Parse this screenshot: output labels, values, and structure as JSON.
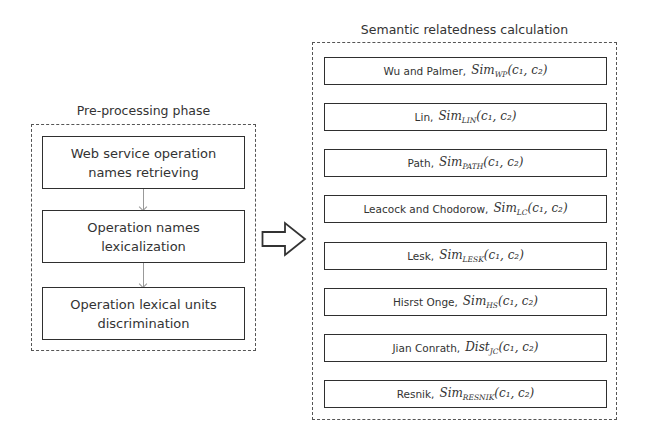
{
  "left_panel": {
    "title": "Pre-processing phase",
    "steps": [
      {
        "line1": "Web service operation",
        "line2": "names retrieving"
      },
      {
        "line1": "Operation names",
        "line2": "lexicalization"
      },
      {
        "line1": "Operation lexical units",
        "line2": "discrimination"
      }
    ]
  },
  "connector": {
    "icon": "block-arrow-right-icon"
  },
  "right_panel": {
    "title": "Semantic relatedness calculation",
    "measures": [
      {
        "name": "Wu and Palmer,",
        "fn": "Sim",
        "sub": "WP",
        "args": "(c₁, c₂)"
      },
      {
        "name": "Lin,",
        "fn": "Sim",
        "sub": "LIN",
        "args": "(c₁, c₂)"
      },
      {
        "name": "Path,",
        "fn": "Sim",
        "sub": "PATH",
        "args": "(c₁, c₂)"
      },
      {
        "name": "Leacock and Chodorow,",
        "fn": "Sim",
        "sub": "LC",
        "args": "(c₁, c₂)"
      },
      {
        "name": "Lesk,",
        "fn": "Sim",
        "sub": "LESK",
        "args": "(c₁, c₂)"
      },
      {
        "name": "Hisrst Onge,",
        "fn": "Sim",
        "sub": "HS",
        "args": "(c₁, c₂)"
      },
      {
        "name": "Jian Conrath,",
        "fn": "Dist",
        "sub": "JC",
        "args": "(c₁, c₂)"
      },
      {
        "name": "Resnik,",
        "fn": "Sim",
        "sub": "RESNIK",
        "args": "(c₁, c₂)"
      }
    ]
  }
}
